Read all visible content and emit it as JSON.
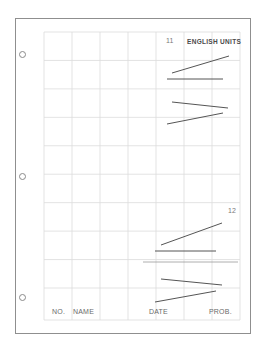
{
  "sheet": {
    "header": {
      "units_label": "ENGLISH UNITS"
    },
    "footer": {
      "number_label": "NO.",
      "name_label": "NAME",
      "date_label": "DATE",
      "problem_label": "PROB."
    },
    "grid": {
      "columns": 7,
      "rows": 10
    },
    "binder_holes": 3,
    "problems": [
      {
        "number": "11",
        "strokes": 4
      },
      {
        "number": "12",
        "strokes": 5
      }
    ]
  }
}
